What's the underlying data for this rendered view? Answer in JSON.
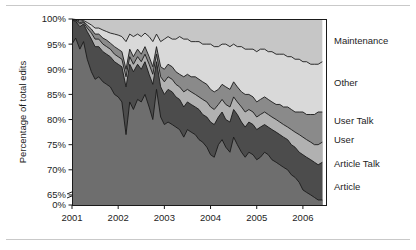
{
  "figure": {
    "background_color": "#ffffff",
    "rule_color": "#c9c9c9",
    "frame_color": "#1a1a1a"
  },
  "chart_data": {
    "type": "area",
    "stacked": true,
    "title": "",
    "subtitle": "",
    "xlabel": "",
    "ylabel": "Percentage of total edits",
    "xlim": [
      2001.0,
      2006.5
    ],
    "ylim": [
      63.0,
      100.0
    ],
    "y_axis_break": true,
    "y_axis_break_note": "axis broken between 0% and 63%; baseline tick shown as 0%",
    "grid": false,
    "legend_position": "right",
    "xticks": [
      2001,
      2002,
      2003,
      2004,
      2005,
      2006
    ],
    "xtick_labels": [
      "2001",
      "2002",
      "2003",
      "2004",
      "2005",
      "2006"
    ],
    "yticks": [
      65,
      70,
      75,
      80,
      85,
      90,
      95,
      100
    ],
    "ytick_labels": [
      "65%",
      "70%",
      "75%",
      "80%",
      "85%",
      "90%",
      "95%",
      "100%"
    ],
    "y_baseline_label": "0%",
    "colors": {
      "Article": "#6e6e6e",
      "Article Talk": "#4c4c4c",
      "User": "#b1b1b1",
      "User Talk": "#8a8a8a",
      "Other": "#d9d9d9",
      "Maintenance": "#c6c6c6"
    },
    "legend_entries": [
      {
        "label": "Maintenance",
        "color": "#d9d9d9"
      },
      {
        "label": "Other",
        "color": "#d9d9d9"
      },
      {
        "label": "User Talk",
        "color": "#8a8a8a"
      },
      {
        "label": "User",
        "color": "#b1b1b1"
      },
      {
        "label": "Article Talk",
        "color": "#4c4c4c"
      },
      {
        "label": "Article",
        "color": "#6e6e6e"
      }
    ],
    "x": [
      2001.0,
      2001.08,
      2001.17,
      2001.25,
      2001.33,
      2001.42,
      2001.5,
      2001.58,
      2001.67,
      2001.75,
      2001.83,
      2001.92,
      2002.0,
      2002.08,
      2002.17,
      2002.25,
      2002.33,
      2002.42,
      2002.5,
      2002.58,
      2002.67,
      2002.75,
      2002.83,
      2002.92,
      2003.0,
      2003.08,
      2003.17,
      2003.25,
      2003.33,
      2003.42,
      2003.5,
      2003.58,
      2003.67,
      2003.75,
      2003.83,
      2003.92,
      2004.0,
      2004.08,
      2004.17,
      2004.25,
      2004.33,
      2004.42,
      2004.5,
      2004.58,
      2004.67,
      2004.75,
      2004.83,
      2004.92,
      2005.0,
      2005.08,
      2005.17,
      2005.25,
      2005.33,
      2005.42,
      2005.5,
      2005.58,
      2005.67,
      2005.75,
      2005.83,
      2005.92,
      2006.0,
      2006.08,
      2006.17,
      2006.25,
      2006.33,
      2006.42
    ],
    "series": [
      {
        "name": "Article",
        "comment": "cumulative upper boundary of the Article band (percent of total edits)",
        "cumulative_top": [
          95.0,
          96.2,
          94.0,
          95.5,
          92.0,
          89.5,
          88.0,
          88.5,
          87.5,
          87.0,
          86.5,
          85.0,
          84.5,
          83.5,
          77.0,
          83.5,
          82.0,
          84.0,
          83.5,
          85.0,
          82.5,
          80.0,
          86.0,
          80.5,
          79.0,
          79.5,
          79.0,
          78.5,
          78.0,
          76.5,
          78.0,
          77.5,
          77.0,
          76.0,
          75.5,
          74.5,
          73.0,
          72.5,
          75.0,
          76.0,
          74.5,
          73.5,
          76.5,
          75.0,
          73.5,
          72.5,
          73.5,
          73.0,
          72.0,
          72.5,
          73.5,
          73.0,
          72.0,
          71.5,
          71.0,
          70.5,
          70.0,
          69.0,
          68.5,
          67.5,
          66.0,
          65.5,
          65.0,
          64.5,
          64.0,
          64.0
        ]
      },
      {
        "name": "Article Talk",
        "comment": "cumulative upper boundary after adding Article Talk",
        "cumulative_top": [
          99.8,
          99.5,
          98.5,
          99.0,
          97.5,
          96.0,
          94.5,
          94.5,
          93.5,
          93.0,
          92.5,
          91.5,
          91.0,
          90.5,
          86.5,
          91.0,
          89.5,
          91.0,
          90.0,
          91.5,
          89.0,
          87.0,
          91.5,
          86.5,
          85.0,
          86.0,
          85.5,
          84.5,
          84.0,
          82.5,
          83.5,
          83.0,
          82.5,
          82.0,
          81.0,
          80.5,
          79.5,
          79.0,
          80.5,
          81.5,
          80.0,
          79.5,
          82.0,
          81.0,
          79.5,
          78.5,
          79.5,
          79.0,
          78.0,
          78.5,
          79.0,
          78.5,
          78.0,
          77.5,
          77.0,
          76.5,
          76.0,
          75.0,
          74.5,
          73.5,
          73.0,
          72.5,
          72.0,
          71.5,
          71.0,
          71.5
        ]
      },
      {
        "name": "User",
        "comment": "cumulative upper boundary after adding User",
        "cumulative_top": [
          99.9,
          99.7,
          99.0,
          99.3,
          98.2,
          97.2,
          96.0,
          96.0,
          95.0,
          94.5,
          94.0,
          93.0,
          92.5,
          92.0,
          88.5,
          92.5,
          91.0,
          92.5,
          91.5,
          93.0,
          91.0,
          89.0,
          93.0,
          88.5,
          87.5,
          88.5,
          88.0,
          87.0,
          86.5,
          85.5,
          86.0,
          85.5,
          85.0,
          84.5,
          84.0,
          83.5,
          82.5,
          82.0,
          83.0,
          84.0,
          83.0,
          82.5,
          84.5,
          83.5,
          82.5,
          81.5,
          82.0,
          81.5,
          80.5,
          81.0,
          81.5,
          81.0,
          80.5,
          80.0,
          79.5,
          79.0,
          78.5,
          78.0,
          77.5,
          77.0,
          76.5,
          76.0,
          75.5,
          75.0,
          75.0,
          75.5
        ]
      },
      {
        "name": "User Talk",
        "comment": "cumulative upper boundary after adding User Talk",
        "cumulative_top": [
          99.95,
          99.8,
          99.3,
          99.5,
          98.8,
          98.0,
          97.0,
          97.0,
          96.2,
          95.8,
          95.2,
          94.5,
          94.0,
          93.5,
          90.0,
          94.0,
          92.5,
          94.0,
          93.0,
          94.5,
          92.5,
          90.5,
          94.5,
          90.5,
          90.0,
          91.0,
          90.5,
          89.5,
          89.0,
          88.5,
          89.0,
          88.5,
          88.5,
          88.0,
          87.5,
          87.0,
          86.0,
          85.5,
          86.0,
          87.0,
          86.5,
          86.0,
          87.5,
          86.5,
          85.5,
          85.0,
          85.0,
          84.5,
          83.5,
          84.0,
          84.5,
          84.0,
          83.5,
          83.0,
          83.0,
          82.5,
          82.5,
          82.0,
          81.5,
          81.5,
          81.5,
          81.0,
          81.0,
          81.0,
          81.5,
          81.5
        ]
      },
      {
        "name": "Other",
        "comment": "cumulative upper boundary after adding Other (Maintenance fills remainder to 100%)",
        "cumulative_top": [
          100.0,
          99.9,
          99.6,
          99.7,
          99.3,
          98.8,
          98.2,
          98.2,
          97.8,
          97.5,
          97.2,
          97.0,
          96.8,
          96.5,
          95.5,
          97.0,
          96.5,
          97.0,
          96.5,
          97.2,
          96.5,
          95.5,
          97.0,
          95.5,
          96.0,
          96.5,
          96.0,
          96.0,
          96.5,
          96.0,
          96.0,
          95.5,
          95.5,
          95.5,
          95.0,
          95.0,
          95.0,
          94.5,
          94.5,
          95.0,
          95.0,
          94.5,
          95.0,
          94.5,
          94.5,
          94.0,
          94.0,
          94.0,
          93.5,
          94.0,
          94.0,
          93.5,
          93.5,
          93.0,
          93.0,
          93.0,
          92.5,
          92.5,
          92.0,
          92.0,
          91.5,
          91.5,
          91.0,
          91.0,
          91.0,
          91.5
        ]
      },
      {
        "name": "Maintenance",
        "comment": "top band, always reaches 100%",
        "cumulative_top": [
          100,
          100,
          100,
          100,
          100,
          100,
          100,
          100,
          100,
          100,
          100,
          100,
          100,
          100,
          100,
          100,
          100,
          100,
          100,
          100,
          100,
          100,
          100,
          100,
          100,
          100,
          100,
          100,
          100,
          100,
          100,
          100,
          100,
          100,
          100,
          100,
          100,
          100,
          100,
          100,
          100,
          100,
          100,
          100,
          100,
          100,
          100,
          100,
          100,
          100,
          100,
          100,
          100,
          100,
          100,
          100,
          100,
          100,
          100,
          100,
          100,
          100,
          100,
          100,
          100,
          100
        ]
      }
    ]
  },
  "plot_geometry": {
    "left": 72,
    "right": 326,
    "top": 19,
    "bottom": 205,
    "baseline_tick_y": 205,
    "axis_top_value": 100,
    "axis_break_low_value": 63
  },
  "legend_label_positions": {
    "Maintenance": 44,
    "Other": 86,
    "User Talk": 124,
    "User": 143,
    "Article Talk": 167,
    "Article": 190
  }
}
